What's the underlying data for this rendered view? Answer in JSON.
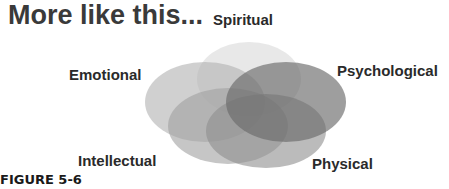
{
  "title": "More like this...",
  "caption": "FIGURE 5-6",
  "diagram": {
    "type": "overlapping-ellipses",
    "labels": {
      "spiritual": "Spiritual",
      "emotional": "Emotional",
      "psychological": "Psychological",
      "intellectual": "Intellectual",
      "physical": "Physical"
    },
    "colors": {
      "spiritual": "#e6e6e6",
      "emotional": "#b4b4b4",
      "psychological": "#6e6e6e",
      "intellectual": "#9a9a9a",
      "physical": "#8a8a8a"
    }
  }
}
